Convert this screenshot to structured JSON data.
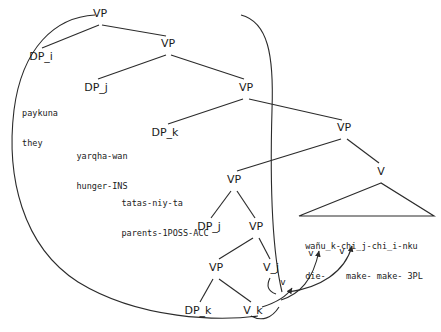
{
  "diagram": {
    "kind": "syntax-tree",
    "language_example": "Quechua causative",
    "stroke_color": "#2b2b2b",
    "text_color": "#1a1a1a",
    "background": "#ffffff"
  },
  "nodes": [
    {
      "id": "vp-root",
      "label": "VP",
      "x": 100,
      "y": 14
    },
    {
      "id": "dp-i",
      "label": "DP_i",
      "x": 41,
      "y": 57
    },
    {
      "id": "vp-2",
      "label": "VP",
      "x": 168,
      "y": 44
    },
    {
      "id": "dp-j",
      "label": "DP_j",
      "x": 96,
      "y": 88
    },
    {
      "id": "vp-3",
      "label": "VP",
      "x": 246,
      "y": 88
    },
    {
      "id": "dp-k",
      "label": "DP_k",
      "x": 165,
      "y": 133
    },
    {
      "id": "vp-4",
      "label": "VP",
      "x": 344,
      "y": 128
    },
    {
      "id": "vp-5",
      "label": "VP",
      "x": 234,
      "y": 180
    },
    {
      "id": "v-head",
      "label": "V",
      "x": 381,
      "y": 172
    },
    {
      "id": "dp-j-2",
      "label": "DP_j",
      "x": 209,
      "y": 227
    },
    {
      "id": "vp-6",
      "label": "VP",
      "x": 256,
      "y": 227
    },
    {
      "id": "v-j",
      "label": "V_j",
      "x": 271,
      "y": 268
    },
    {
      "id": "vp-7",
      "label": "VP",
      "x": 216,
      "y": 268
    },
    {
      "id": "dp-k-2",
      "label": "DP_k",
      "x": 198,
      "y": 311
    },
    {
      "id": "v-k",
      "label": "V_k",
      "x": 253,
      "y": 311
    }
  ],
  "terminals": [
    {
      "id": "term-paykuna",
      "parent": "dp-i",
      "x": 40,
      "y": 88,
      "lines": [
        "paykuna",
        "they"
      ]
    },
    {
      "id": "term-yarqhawan",
      "parent": "dp-j",
      "x": 102,
      "y": 131,
      "lines": [
        "yarqha-wan",
        "hunger-INS"
      ]
    },
    {
      "id": "term-tatasniyta",
      "parent": "dp-k",
      "x": 165,
      "y": 178,
      "lines": [
        "tatas-niy-ta",
        "parents-1POSS-ACC"
      ]
    },
    {
      "id": "term-verb-complex",
      "parent": "v-head",
      "x": 364,
      "y": 221,
      "lines": [
        "wañu_k-chi_j-chi_i-nku",
        "die-    make- make- 3PL"
      ]
    }
  ],
  "movement_labels": [
    {
      "id": "mv-v-1",
      "label": "v",
      "x": 283,
      "y": 283
    },
    {
      "id": "mv-v-2",
      "label": "v",
      "x": 311,
      "y": 254
    },
    {
      "id": "mv-v-3",
      "label": "v",
      "x": 342,
      "y": 252
    }
  ],
  "edges": [
    {
      "from": "vp-root",
      "to": "dp-i"
    },
    {
      "from": "vp-root",
      "to": "vp-2"
    },
    {
      "from": "vp-2",
      "to": "dp-j"
    },
    {
      "from": "vp-2",
      "to": "vp-3"
    },
    {
      "from": "vp-3",
      "to": "dp-k"
    },
    {
      "from": "vp-3",
      "to": "vp-4"
    },
    {
      "from": "vp-4",
      "to": "vp-5"
    },
    {
      "from": "vp-4",
      "to": "v-head"
    },
    {
      "from": "vp-5",
      "to": "dp-j-2"
    },
    {
      "from": "vp-5",
      "to": "vp-6"
    },
    {
      "from": "vp-6",
      "to": "vp-7"
    },
    {
      "from": "vp-6",
      "to": "v-j"
    },
    {
      "from": "vp-7",
      "to": "dp-k-2"
    },
    {
      "from": "vp-7",
      "to": "v-k"
    }
  ]
}
